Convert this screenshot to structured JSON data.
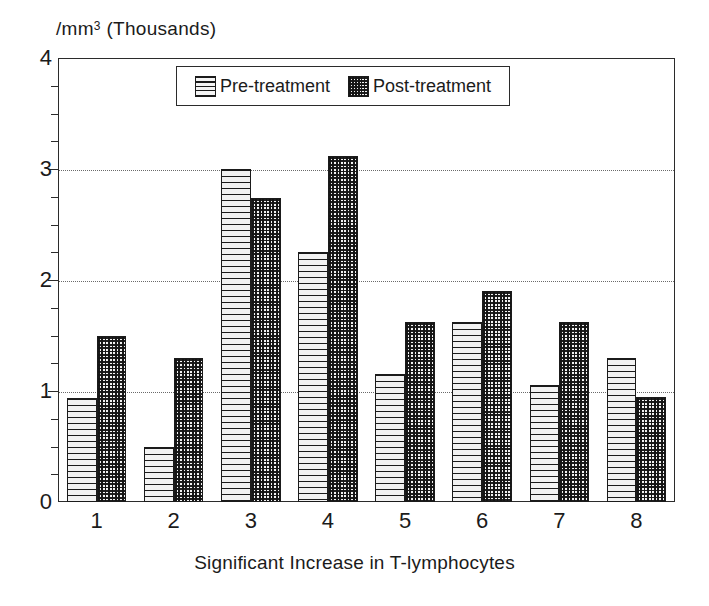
{
  "chart_data": {
    "type": "bar",
    "title": "",
    "subtitle": "",
    "xlabel": "Significant Increase in T-lymphocytes",
    "ylabel": "/mm³ (Thousands)",
    "ylabel_main": "/mm",
    "ylabel_sup": "3",
    "ylabel_tail": " (Thousands)",
    "categories": [
      "1",
      "2",
      "3",
      "4",
      "5",
      "6",
      "7",
      "8"
    ],
    "series": [
      {
        "name": "Pre-treatment",
        "pattern": "horizontal-lines",
        "values": [
          0.94,
          0.5,
          3.0,
          2.25,
          1.15,
          1.62,
          1.05,
          1.3
        ]
      },
      {
        "name": "Post-treatment",
        "pattern": "crosshatch",
        "values": [
          1.5,
          1.3,
          2.74,
          3.12,
          1.62,
          1.9,
          1.62,
          0.95
        ]
      }
    ],
    "ylim": [
      0,
      4
    ],
    "y_ticks": [
      0,
      1,
      2,
      3,
      4
    ],
    "y_tick_labels": [
      "0",
      "1",
      "2",
      "3",
      "4"
    ],
    "y_minor_tick_step": 0.25,
    "grid": true,
    "grid_axis": "y",
    "grid_style": "dotted",
    "grid_values": [
      1,
      2,
      3
    ],
    "legend_position": "top-center",
    "legend_entries": [
      "Pre-treatment",
      "Post-treatment"
    ],
    "colors": {
      "axis": "#2b2b2b",
      "grid": "#6a6a6a",
      "text": "#1b1b1b",
      "pre_fill": "#f2f2f2",
      "post_fill": "#6e6e6e",
      "background": "#ffffff"
    }
  }
}
